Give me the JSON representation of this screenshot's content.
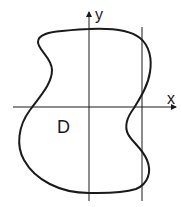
{
  "diagram": {
    "axes": {
      "x_label": "x",
      "y_label": "y"
    },
    "region_label": "D",
    "colors": {
      "stroke": "#1a1a1a",
      "background": "#ffffff"
    }
  }
}
